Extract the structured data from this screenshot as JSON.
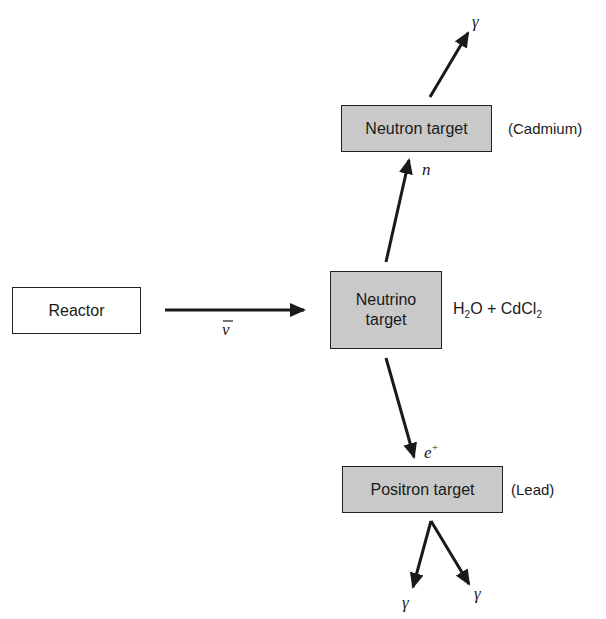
{
  "diagram": {
    "nodes": {
      "reactor": {
        "label": "Reactor"
      },
      "neutrino_target": {
        "line1": "Neutrino",
        "line2": "target",
        "note_pre": "H",
        "note_sub1": "2",
        "note_mid": "O + CdCl",
        "note_sub2": "2"
      },
      "neutron_target": {
        "label": "Neutron target",
        "note": "(Cadmium)"
      },
      "positron_target": {
        "label": "Positron target",
        "note": "(Lead)"
      }
    },
    "edge_labels": {
      "antineutrino": "ν",
      "neutron": "n",
      "positron": "e",
      "positron_sup": "+",
      "gamma_top": "γ",
      "gamma_left": "γ",
      "gamma_right": "γ"
    },
    "edges": [
      {
        "from": "reactor",
        "to": "neutrino_target",
        "label": "ν̄"
      },
      {
        "from": "neutrino_target",
        "to": "neutron_target",
        "label": "n"
      },
      {
        "from": "neutron_target",
        "to": "out",
        "label": "γ"
      },
      {
        "from": "neutrino_target",
        "to": "positron_target",
        "label": "e+"
      },
      {
        "from": "positron_target",
        "to": "out",
        "label": "γ"
      },
      {
        "from": "positron_target",
        "to": "out",
        "label": "γ"
      }
    ],
    "colors": {
      "box_fill": "#c9c9c9",
      "stroke": "#1a1a1a"
    }
  }
}
